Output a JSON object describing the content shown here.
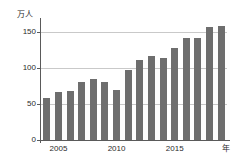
{
  "chart_data": {
    "type": "bar",
    "title": "",
    "subtitle": "",
    "xlabel": "年",
    "ylabel": "万人",
    "categories": [
      2004,
      2005,
      2006,
      2007,
      2008,
      2009,
      2010,
      2011,
      2012,
      2013,
      2014,
      2015,
      2016,
      2017,
      2018,
      2019
    ],
    "values": [
      58,
      67,
      68,
      80,
      85,
      81,
      69,
      97,
      111,
      117,
      114,
      128,
      142,
      141,
      157,
      158
    ],
    "ylim": [
      0,
      165
    ],
    "yticks": [
      0,
      50,
      100,
      150
    ],
    "ytick_labels": [
      "0",
      "50",
      "100",
      "150"
    ],
    "xtick_positions": [
      2005,
      2010,
      2015
    ],
    "xtick_labels": [
      "2005",
      "2010",
      "2015"
    ],
    "grid": true,
    "gridlines_at": [
      50,
      100,
      150
    ],
    "legend": null,
    "bar_color": "#6e6e6e",
    "axis_color": "#5a5a5a",
    "grid_color": "#c9c9c9",
    "background": "#ffffff"
  },
  "axes": {
    "y_title": "万人",
    "x_title": "年"
  }
}
